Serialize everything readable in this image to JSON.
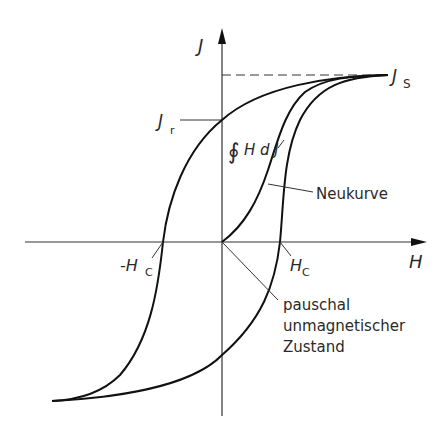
{
  "diagram": {
    "axes": {
      "y_label": "J",
      "x_label": "H"
    },
    "labels": {
      "saturation": "J",
      "saturation_sub": "S",
      "remanence": "J",
      "remanence_sub": "r",
      "coercive_neg": "-H",
      "coercive_neg_sub": "C",
      "coercive_pos": "H",
      "coercive_pos_sub": "C",
      "integral": "∮ H d J",
      "integral_symbol": "∮",
      "integral_body": "H d J",
      "new_curve": "Neukurve",
      "demag_line1": "pauschal",
      "demag_line2": "unmagnetischer",
      "demag_line3": "Zustand"
    },
    "colors": {
      "curve": "#111111",
      "axis": "#333333",
      "text": "#2a2a2a"
    }
  }
}
